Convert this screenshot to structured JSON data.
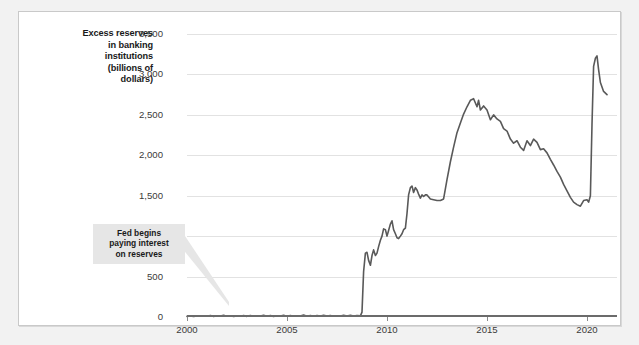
{
  "figure": {
    "background_color": "#f2f2f2",
    "panel_color": "#ffffff",
    "border_color": "#c9c9c9"
  },
  "annotation": {
    "line1": "Fed begins",
    "line2": "paying interest",
    "line3": "on reserves"
  },
  "axis_title": {
    "line1": "Excess reserves",
    "line2": "in banking",
    "line3": "institutions",
    "line4": "(billions of",
    "line5": "dollars)"
  },
  "chart_data": {
    "type": "line",
    "title": "",
    "subtitle": "",
    "xlabel": "",
    "ylabel": "Excess reserves in banking institutions (billions of dollars)",
    "xlim": [
      2000,
      2021.5
    ],
    "ylim": [
      0,
      3500
    ],
    "grid": true,
    "grid_axis": "y",
    "legend": false,
    "line_color": "#595959",
    "line_width": 1.6,
    "ytick_labels": [
      "0",
      "500",
      "1,000",
      "1,500",
      "2,000",
      "2,500",
      "3,000",
      "3,500"
    ],
    "ytick_values": [
      0,
      500,
      1000,
      1500,
      2000,
      2500,
      3000,
      3500
    ],
    "xtick_labels": [
      "2000",
      "2005",
      "2010",
      "2015",
      "2020"
    ],
    "xtick_values": [
      2000,
      2005,
      2010,
      2015,
      2020
    ],
    "series": [
      {
        "name": "Excess reserves",
        "x": [
          2000.0,
          2000.17,
          2000.33,
          2000.5,
          2000.67,
          2000.83,
          2001.0,
          2001.17,
          2001.33,
          2001.5,
          2001.67,
          2001.83,
          2002.0,
          2002.17,
          2002.33,
          2002.5,
          2002.67,
          2002.83,
          2003.0,
          2003.17,
          2003.33,
          2003.5,
          2003.67,
          2003.83,
          2004.0,
          2004.17,
          2004.33,
          2004.5,
          2004.67,
          2004.83,
          2005.0,
          2005.17,
          2005.33,
          2005.5,
          2005.67,
          2005.83,
          2006.0,
          2006.17,
          2006.33,
          2006.5,
          2006.67,
          2006.83,
          2007.0,
          2007.17,
          2007.33,
          2007.5,
          2007.67,
          2007.83,
          2008.0,
          2008.17,
          2008.33,
          2008.5,
          2008.67,
          2008.75,
          2008.83,
          2008.92,
          2009.0,
          2009.08,
          2009.17,
          2009.25,
          2009.33,
          2009.42,
          2009.5,
          2009.58,
          2009.67,
          2009.75,
          2009.83,
          2009.92,
          2010.0,
          2010.08,
          2010.17,
          2010.25,
          2010.33,
          2010.42,
          2010.5,
          2010.58,
          2010.67,
          2010.75,
          2010.83,
          2010.92,
          2011.0,
          2011.08,
          2011.17,
          2011.25,
          2011.33,
          2011.42,
          2011.5,
          2011.58,
          2011.67,
          2011.75,
          2011.83,
          2011.92,
          2012.0,
          2012.17,
          2012.33,
          2012.5,
          2012.67,
          2012.83,
          2013.0,
          2013.17,
          2013.33,
          2013.5,
          2013.67,
          2013.83,
          2014.0,
          2014.17,
          2014.33,
          2014.5,
          2014.58,
          2014.67,
          2014.83,
          2015.0,
          2015.17,
          2015.33,
          2015.5,
          2015.67,
          2015.83,
          2016.0,
          2016.17,
          2016.33,
          2016.5,
          2016.67,
          2016.83,
          2017.0,
          2017.17,
          2017.33,
          2017.5,
          2017.67,
          2017.83,
          2018.0,
          2018.17,
          2018.33,
          2018.5,
          2018.67,
          2018.83,
          2019.0,
          2019.17,
          2019.33,
          2019.5,
          2019.67,
          2019.83,
          2020.0,
          2020.08,
          2020.17,
          2020.25,
          2020.33,
          2020.42,
          2020.5,
          2020.58,
          2020.67,
          2020.83,
          2021.0
        ],
        "values": [
          8,
          12,
          6,
          14,
          9,
          16,
          10,
          18,
          8,
          15,
          11,
          20,
          9,
          16,
          7,
          14,
          10,
          17,
          8,
          19,
          9,
          15,
          11,
          22,
          10,
          17,
          8,
          16,
          12,
          20,
          9,
          18,
          10,
          15,
          11,
          24,
          10,
          19,
          9,
          17,
          12,
          21,
          11,
          18,
          10,
          16,
          13,
          22,
          12,
          20,
          11,
          18,
          14,
          60,
          560,
          790,
          800,
          700,
          640,
          760,
          830,
          760,
          790,
          870,
          950,
          1000,
          1090,
          1080,
          1000,
          1070,
          1150,
          1190,
          1080,
          1030,
          980,
          970,
          1000,
          1030,
          1080,
          1100,
          1280,
          1510,
          1600,
          1620,
          1540,
          1600,
          1570,
          1520,
          1470,
          1510,
          1490,
          1510,
          1510,
          1460,
          1450,
          1440,
          1440,
          1460,
          1700,
          1920,
          2100,
          2280,
          2400,
          2510,
          2600,
          2680,
          2700,
          2600,
          2680,
          2560,
          2610,
          2560,
          2440,
          2500,
          2450,
          2420,
          2330,
          2300,
          2200,
          2150,
          2180,
          2100,
          2060,
          2180,
          2120,
          2200,
          2160,
          2070,
          2080,
          2030,
          1950,
          1880,
          1800,
          1730,
          1640,
          1560,
          1480,
          1420,
          1390,
          1370,
          1440,
          1450,
          1420,
          1500,
          2380,
          3100,
          3200,
          3230,
          3060,
          2900,
          2790,
          2750
        ]
      }
    ],
    "annotations": [
      {
        "text": "Fed begins paying interest on reserves",
        "x": 2008.75,
        "y": 0
      }
    ]
  }
}
